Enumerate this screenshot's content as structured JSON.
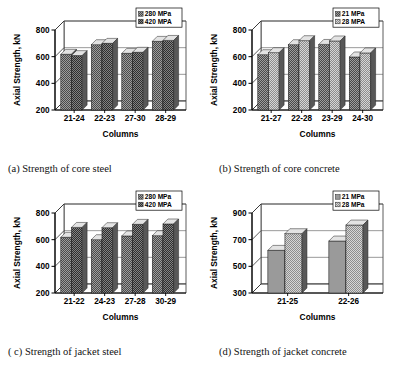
{
  "figure": {
    "panels": [
      "a",
      "b",
      "c",
      "d"
    ]
  },
  "panel_a": {
    "caption": "(a) Strength of core steel",
    "chart_data": {
      "type": "bar",
      "title": "",
      "xlabel": "Columns",
      "ylabel": "Axial Strength, kN",
      "categories": [
        "21-24",
        "22-23",
        "27-30",
        "28-29"
      ],
      "yticks": [
        200,
        400,
        600,
        800
      ],
      "ylim": [
        200,
        800
      ],
      "grid": true,
      "legend_position": "top-right",
      "series": [
        {
          "name": "280 MPa",
          "values": [
            618,
            690,
            625,
            715
          ],
          "color": "#8f8f8f",
          "pattern": "checker-dark"
        },
        {
          "name": "420 MPA",
          "values": [
            608,
            700,
            633,
            722
          ],
          "color": "#7a7a7a",
          "pattern": "checker-darker"
        }
      ]
    }
  },
  "panel_b": {
    "caption": "(b) Strength of core concrete",
    "chart_data": {
      "type": "bar",
      "title": "",
      "xlabel": "Columns",
      "ylabel": "Axial Strength, kN",
      "categories": [
        "21-27",
        "22-28",
        "23-29",
        "24-30"
      ],
      "yticks": [
        200,
        400,
        600,
        800
      ],
      "ylim": [
        200,
        800
      ],
      "grid": true,
      "legend_position": "top-right",
      "series": [
        {
          "name": "21 MPa",
          "values": [
            615,
            690,
            692,
            598
          ],
          "color": "#8f8f8f",
          "pattern": "checker-dark"
        },
        {
          "name": "28 MPA",
          "values": [
            630,
            720,
            718,
            628
          ],
          "color": "#bdbdbd",
          "pattern": "checker-light"
        }
      ]
    }
  },
  "panel_c": {
    "caption": "( c) Strength of jacket steel",
    "chart_data": {
      "type": "bar",
      "title": "",
      "xlabel": "Columns",
      "ylabel": "Axial Strength, kN",
      "categories": [
        "21-22",
        "24-23",
        "27-28",
        "30-29"
      ],
      "yticks": [
        200,
        400,
        600,
        800
      ],
      "ylim": [
        200,
        800
      ],
      "grid": true,
      "legend_position": "top-right",
      "series": [
        {
          "name": "280 MPa",
          "values": [
            618,
            600,
            628,
            630
          ],
          "color": "#9a9a9a",
          "pattern": "checker-dark"
        },
        {
          "name": "420 MPA",
          "values": [
            692,
            690,
            715,
            718
          ],
          "color": "#808080",
          "pattern": "checker-darker"
        }
      ]
    }
  },
  "panel_d": {
    "caption": "(d) Strength of jacket concrete",
    "chart_data": {
      "type": "bar",
      "title": "",
      "xlabel": "Columns",
      "ylabel": "Axial Strength, kN",
      "categories": [
        "21-25",
        "22-26"
      ],
      "yticks": [
        300,
        500,
        700,
        900
      ],
      "ylim": [
        300,
        900
      ],
      "grid": true,
      "legend_position": "top-right",
      "series": [
        {
          "name": "21 MPa",
          "values": [
            620,
            690
          ],
          "color": "#949494",
          "pattern": "solid-gray"
        },
        {
          "name": "28 MPa",
          "values": [
            745,
            810
          ],
          "color": "#cfcfcf",
          "pattern": "checker-light"
        }
      ]
    }
  }
}
